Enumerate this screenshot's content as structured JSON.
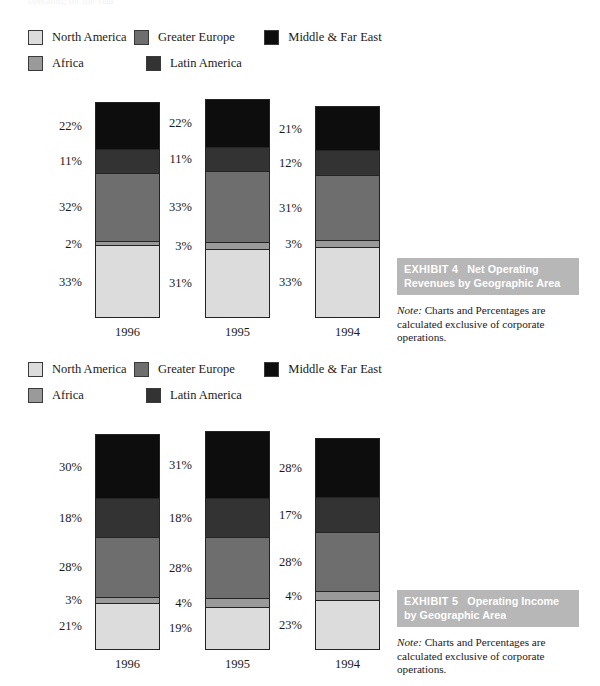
{
  "page": {
    "top_clipped_text": "operating  for  the  year"
  },
  "colors": {
    "north_america": "#dcdcdc",
    "africa": "#9a9a9a",
    "greater_europe": "#6e6e6e",
    "latin_america": "#333333",
    "middle_far_east": "#0d0d0d",
    "bar_outline": "#242424",
    "exhibit_band_bg": "#b7b7b7",
    "exhibit_band_text": "#ffffff"
  },
  "legend": {
    "rows": [
      [
        {
          "label": "North America",
          "color_key": "north_america"
        },
        {
          "label": "Greater Europe",
          "color_key": "greater_europe"
        },
        {
          "label": "Middle & Far East",
          "color_key": "middle_far_east"
        }
      ],
      [
        {
          "label": "Africa",
          "color_key": "africa"
        },
        {
          "label": "Latin America",
          "color_key": "latin_america"
        }
      ]
    ]
  },
  "exhibits": [
    {
      "number_label": "EXHIBIT 4",
      "title": "Net Operating Revenues by Geographic Area",
      "note_word": "Note:",
      "note_text": " Charts and Percentages are calculated exclusive of corporate operations."
    },
    {
      "number_label": "EXHIBIT 5",
      "title": "Operating Income by Geographic Area",
      "note_word": "Note:",
      "note_text": " Charts and Percentages are calculated exclusive of corporate operations."
    }
  ],
  "chart_data": [
    {
      "type": "bar",
      "stacked": true,
      "title": "Net Operating Revenues by Geographic Area",
      "xlabel": "",
      "ylabel": "",
      "categories": [
        "1996",
        "1995",
        "1994"
      ],
      "grid": false,
      "legend_position": "top",
      "total_heights_px": [
        214,
        217,
        210
      ],
      "series": [
        {
          "name": "Middle & Far East",
          "color_key": "middle_far_east",
          "values": [
            22,
            22,
            21
          ],
          "labels": [
            "22%",
            "22%",
            "21%"
          ]
        },
        {
          "name": "Latin America",
          "color_key": "latin_america",
          "values": [
            11,
            11,
            12
          ],
          "labels": [
            "11%",
            "11%",
            "12%"
          ]
        },
        {
          "name": "Greater Europe",
          "color_key": "greater_europe",
          "values": [
            32,
            33,
            31
          ],
          "labels": [
            "32%",
            "33%",
            "31%"
          ]
        },
        {
          "name": "Africa",
          "color_key": "africa",
          "values": [
            2,
            3,
            3
          ],
          "labels": [
            "2%",
            "3%",
            "3%"
          ]
        },
        {
          "name": "North America",
          "color_key": "north_america",
          "values": [
            33,
            31,
            33
          ],
          "labels": [
            "33%",
            "31%",
            "33%"
          ]
        }
      ]
    },
    {
      "type": "bar",
      "stacked": true,
      "title": "Operating Income by Geographic Area",
      "xlabel": "",
      "ylabel": "",
      "categories": [
        "1996",
        "1995",
        "1994"
      ],
      "grid": false,
      "legend_position": "top",
      "total_heights_px": [
        214,
        217,
        210
      ],
      "series": [
        {
          "name": "Middle & Far East",
          "color_key": "middle_far_east",
          "values": [
            30,
            31,
            28
          ],
          "labels": [
            "30%",
            "31%",
            "28%"
          ]
        },
        {
          "name": "Latin America",
          "color_key": "latin_america",
          "values": [
            18,
            18,
            17
          ],
          "labels": [
            "18%",
            "18%",
            "17%"
          ]
        },
        {
          "name": "Greater Europe",
          "color_key": "greater_europe",
          "values": [
            28,
            28,
            28
          ],
          "labels": [
            "28%",
            "28%",
            "28%"
          ]
        },
        {
          "name": "Africa",
          "color_key": "africa",
          "values": [
            3,
            4,
            4
          ],
          "labels": [
            "3%",
            "4%",
            "4%"
          ]
        },
        {
          "name": "North America",
          "color_key": "north_america",
          "values": [
            21,
            19,
            23
          ],
          "labels": [
            "21%",
            "19%",
            "23%"
          ]
        }
      ]
    }
  ]
}
